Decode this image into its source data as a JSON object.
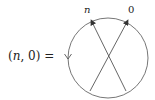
{
  "equation": {
    "open_paren": "(",
    "var_n": "n",
    "comma_zero": ", 0) ="
  },
  "diagram": {
    "labels": {
      "top_left": "n",
      "top_right": "0"
    },
    "circle_orientation_arrow": "down-arrow-on-left-edge",
    "strands": [
      {
        "from": "bottom-right",
        "to": "top-left (n)",
        "arrowhead": "top"
      },
      {
        "from": "bottom-left",
        "to": "top-right (0)",
        "arrowhead": "top"
      }
    ],
    "colors": {
      "stroke": "#555555",
      "text": "#222222"
    }
  }
}
